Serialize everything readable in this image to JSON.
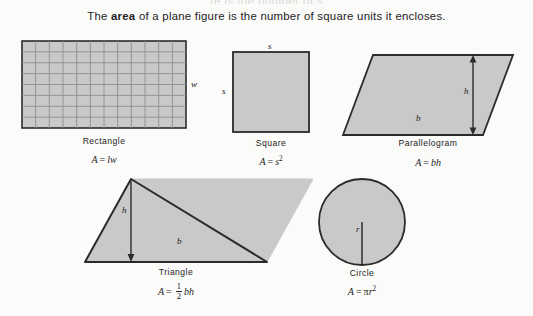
{
  "page": {
    "background_color": "#fbfbfa",
    "ghost_top_line": "re is the number of s",
    "lede_before": "The ",
    "lede_bold": "area",
    "lede_after": " of a plane figure is the number of square units it encloses."
  },
  "style": {
    "shape_fill": "#c9c9c9",
    "shape_stroke": "#2b2b2b",
    "grid_line_color": "#8f8f8f",
    "text_color": "#232323"
  },
  "figures": [
    {
      "id": "rectangle",
      "caption": "Rectangle",
      "formula_lhs": "A",
      "formula_eq": "=",
      "formula_rhs_1": "l",
      "formula_rhs_2": "w",
      "dimension_labels": [
        {
          "name": "width-label",
          "text": "w"
        }
      ],
      "grid": {
        "columns": 12,
        "rows": 8
      },
      "box": {
        "x": 22,
        "y": 41,
        "w": 164,
        "h": 87
      }
    },
    {
      "id": "square",
      "caption": "Square",
      "formula_lhs": "A",
      "formula_eq": "=",
      "formula_rhs_1": "s",
      "formula_exponent": "2",
      "dimension_labels": [
        {
          "name": "side-top-label",
          "text": "s"
        },
        {
          "name": "side-left-label",
          "text": "s"
        }
      ],
      "box": {
        "x": 233,
        "y": 52,
        "w": 76,
        "h": 80
      }
    },
    {
      "id": "parallelogram",
      "caption": "Parallelogram",
      "formula_lhs": "A",
      "formula_eq": "=",
      "formula_rhs_1": "b",
      "formula_rhs_2": "h",
      "dimension_labels": [
        {
          "name": "base-label",
          "text": "b"
        },
        {
          "name": "height-label",
          "text": "h"
        }
      ]
    },
    {
      "id": "triangle",
      "caption": "Triangle",
      "formula_lhs": "A",
      "formula_eq": "=",
      "formula_frac_num": "1",
      "formula_frac_den": "2",
      "formula_rhs_1": "b",
      "formula_rhs_2": "h",
      "dimension_labels": [
        {
          "name": "base-label",
          "text": "b"
        },
        {
          "name": "height-label",
          "text": "h"
        }
      ]
    },
    {
      "id": "circle",
      "caption": "Circle",
      "formula_lhs": "A",
      "formula_eq": "=",
      "formula_pi": "π",
      "formula_rhs_1": "r",
      "formula_exponent": "2",
      "dimension_labels": [
        {
          "name": "radius-label",
          "text": "r"
        }
      ],
      "center": {
        "x": 362,
        "y": 222
      },
      "radius": 43
    }
  ]
}
